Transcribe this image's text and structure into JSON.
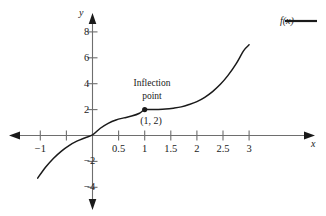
{
  "chart_data": {
    "type": "line",
    "title": "",
    "xlabel": "x",
    "ylabel": "y",
    "xlim": [
      -1.15,
      3.15
    ],
    "ylim": [
      -4.7,
      8.9
    ],
    "grid": false,
    "legend_position": "top-right",
    "series": [
      {
        "name": "f(x)",
        "color": "#1a1a1a",
        "expression": "f(x) = 0.62(x - 1)^3 + 2",
        "x": [
          -1.05,
          -0.9,
          -0.75,
          -0.6,
          -0.45,
          -0.3,
          -0.15,
          0,
          0.15,
          0.3,
          0.45,
          0.6,
          0.75,
          0.9,
          1,
          1.1,
          1.25,
          1.4,
          1.55,
          1.7,
          1.85,
          2,
          2.15,
          2.3,
          2.45,
          2.6,
          2.75,
          2.9,
          3
        ],
        "y": [
          -3.29,
          -2.48,
          -1.78,
          -1.18,
          -0.68,
          -0.28,
          0.02,
          0.24,
          0.4,
          0.51,
          0.58,
          0.62,
          0.64,
          0.65,
          2,
          2.0,
          2.01,
          2.04,
          2.11,
          2.21,
          2.39,
          2.62,
          2.95,
          3.39,
          3.95,
          4.66,
          5.53,
          6.57,
          7.0
        ],
        "y_actual": [
          -3.29,
          -2.45,
          -1.77,
          -1.22,
          -0.78,
          -0.44,
          -0.19,
          0.04,
          0.56,
          0.94,
          1.2,
          1.36,
          1.5,
          1.72,
          2.0,
          2.0,
          2.01,
          2.04,
          2.11,
          2.21,
          2.39,
          2.62,
          2.95,
          3.39,
          3.95,
          4.66,
          5.53,
          6.57,
          7.0
        ]
      }
    ],
    "x_ticks": [
      {
        "value": -1,
        "label": "−1"
      },
      {
        "value": -0.5,
        "label": ""
      },
      {
        "value": 0.5,
        "label": "0.5"
      },
      {
        "value": 1,
        "label": "1"
      },
      {
        "value": 1.5,
        "label": "1.5"
      },
      {
        "value": 2,
        "label": "2"
      },
      {
        "value": 2.5,
        "label": "2.5"
      },
      {
        "value": 3,
        "label": "3"
      }
    ],
    "y_ticks": [
      {
        "value": 8,
        "label": "8"
      },
      {
        "value": 6,
        "label": "6"
      },
      {
        "value": 4,
        "label": "4"
      },
      {
        "value": 2,
        "label": "2"
      },
      {
        "value": -2,
        "label": "−2"
      },
      {
        "value": -4,
        "label": "−4"
      }
    ],
    "annotations": [
      {
        "name": "inflection-point-annotation",
        "text_line1": "Inflection",
        "text_line2": "point",
        "coord_label": "(1, 2)",
        "point": {
          "x": 1,
          "y": 2
        },
        "marker": "filled-circle"
      }
    ]
  },
  "axes": {
    "x_axis_name": "x",
    "y_axis_name": "y"
  },
  "legend": {
    "entries": [
      {
        "label": "f(x)",
        "color": "#1a1a1a",
        "style": "solid-line"
      }
    ]
  },
  "colors": {
    "curve": "#1a1a1a",
    "axis": "#6e6e6e",
    "text": "#1a1a1a",
    "background": "#ffffff"
  }
}
